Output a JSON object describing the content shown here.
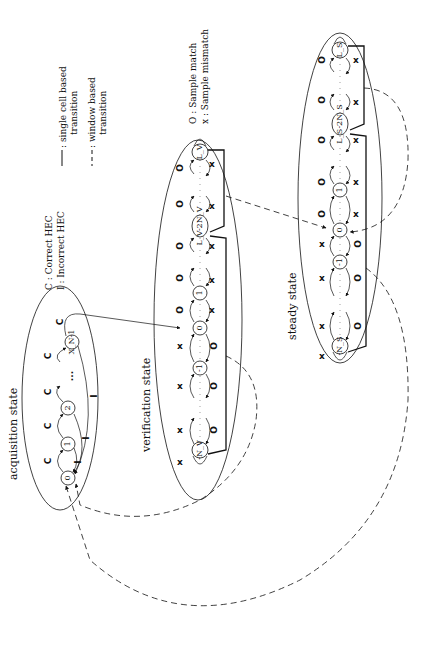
{
  "legend": {
    "single_cell": "single cell based transition",
    "single_cell_l1": ": single cell based",
    "single_cell_l2": "transition",
    "window_l1": ": window based",
    "window_l2": "transition",
    "match": "O : Sample match",
    "mismatch": "x : Sample mismatch",
    "correct": "C : Correct HEC",
    "incorrect": "I : Incorrect HEC"
  },
  "states": {
    "acquisition": {
      "label": "acquisition state",
      "nodes": [
        "0",
        "1",
        "2",
        "X_N-1"
      ],
      "edge_labels": {
        "correct": "C",
        "incorrect": "I"
      }
    },
    "verification": {
      "label": "verification state",
      "nodes": [
        "L_V",
        "L_V-2N_V",
        "1",
        "0",
        "-1",
        "-N_V"
      ]
    },
    "steady": {
      "label": "steady state",
      "nodes": [
        "L_S",
        "L_S-2N_S",
        "1",
        "0",
        "-1",
        "-N_S"
      ]
    }
  },
  "symbols": {
    "match": "O",
    "mismatch": "x",
    "ellipsis": "...",
    "C": "C",
    "I": "I"
  },
  "colors": {
    "ink": "#111111",
    "background": "#ffffff"
  }
}
